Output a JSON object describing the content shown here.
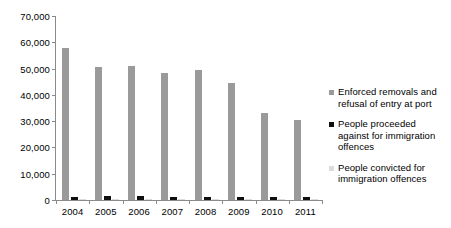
{
  "chart_data": {
    "type": "bar",
    "title": "",
    "subtitle": "",
    "xlabel": "",
    "ylabel": "",
    "categories": [
      "2004",
      "2005",
      "2006",
      "2007",
      "2008",
      "2009",
      "2010",
      "2011"
    ],
    "ylim": [
      0,
      70000
    ],
    "yticks": [
      0,
      10000,
      20000,
      30000,
      40000,
      50000,
      60000,
      70000
    ],
    "ytick_labels": [
      "0",
      "10,000",
      "20,000",
      "30,000",
      "40,000",
      "50,000",
      "60,000",
      "70,000"
    ],
    "grid": false,
    "legend_position": "right",
    "series": [
      {
        "name": "Enforced removals and refusal of entry at port",
        "color": "#9a9a9a",
        "values": [
          58000,
          50500,
          51000,
          48500,
          49500,
          44500,
          33000,
          30500
        ]
      },
      {
        "name": "People proceeded against for immigration offences",
        "color": "#0f0f0f",
        "values": [
          1100,
          1700,
          1500,
          1200,
          1300,
          1200,
          1100,
          1100
        ]
      },
      {
        "name": "People convicted for immigration offences",
        "color": "#dcdcdc",
        "values": [
          350,
          500,
          450,
          350,
          400,
          350,
          300,
          300
        ]
      }
    ]
  },
  "legend": {
    "items": [
      {
        "label": "Enforced removals and refusal of entry at port",
        "swatch": "s1"
      },
      {
        "label": "People proceeded against for immigration offences",
        "swatch": "s2"
      },
      {
        "label": "People convicted for immigration offences",
        "swatch": "s3"
      }
    ]
  }
}
